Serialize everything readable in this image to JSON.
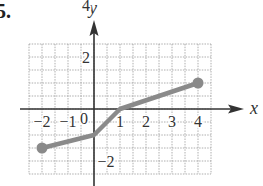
{
  "problem": {
    "number": "5."
  },
  "chart_data": {
    "type": "line",
    "title": "",
    "xlabel": "x",
    "ylabel": "y",
    "xlim": [
      -2.5,
      4.5
    ],
    "ylim": [
      -5,
      5
    ],
    "grid": true,
    "grid_step": 0.5,
    "x_ticks": [
      {
        "value": -2,
        "label": "−2"
      },
      {
        "value": -1,
        "label": "−1"
      },
      {
        "value": 0,
        "label": "0"
      },
      {
        "value": 1,
        "label": "1"
      },
      {
        "value": 2,
        "label": "2"
      },
      {
        "value": 3,
        "label": "3"
      },
      {
        "value": 4,
        "label": "4"
      }
    ],
    "y_ticks": [
      {
        "value": 4,
        "label": "4"
      },
      {
        "value": 2,
        "label": "2"
      },
      {
        "value": -2,
        "label": "−2"
      },
      {
        "value": -4,
        "label": "−4"
      }
    ],
    "series": [
      {
        "name": "f(x)",
        "color": "#8a8a8a",
        "points": [
          [
            -2,
            -3
          ],
          [
            0,
            -2
          ],
          [
            1,
            0
          ],
          [
            4,
            2
          ]
        ],
        "closed_endpoints": [
          [
            -2,
            -3
          ],
          [
            4,
            2
          ]
        ]
      }
    ]
  }
}
